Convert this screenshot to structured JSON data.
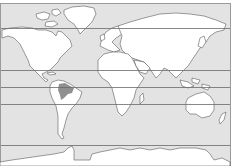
{
  "map": {
    "type": "world-map-outline",
    "projection": "equirectangular-like",
    "colors": {
      "ocean": "#e3e3e3",
      "land": "#ffffff",
      "coastline": "#5a5a5a",
      "latitude_line": "#6a6a6a",
      "highlight": "#8f8f8f",
      "frame": "#9a9a9a"
    },
    "latitude_lines": [
      {
        "name": "arctic-circle",
        "y": 28
      },
      {
        "name": "tropic-of-cancer",
        "y": 70
      },
      {
        "name": "equator",
        "y": 87
      },
      {
        "name": "tropic-of-capricorn",
        "y": 104
      },
      {
        "name": "antarctic-circle",
        "y": 145
      }
    ],
    "highlighted_region": "amazon-basin"
  }
}
